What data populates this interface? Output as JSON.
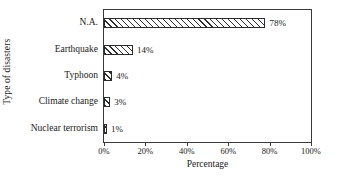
{
  "chart_data": {
    "type": "bar",
    "orientation": "horizontal",
    "title": "",
    "xlabel": "Percentage",
    "ylabel": "Type of disasters",
    "categories": [
      "N.A.",
      "Earthquake",
      "Typhoon",
      "Climate change",
      "Nuclear terrorism"
    ],
    "values": [
      78,
      14,
      4,
      3,
      1
    ],
    "value_labels": [
      "78%",
      "14%",
      "4%",
      "3%",
      "1%"
    ],
    "xlim": [
      0,
      100
    ],
    "x_ticks": [
      0,
      20,
      40,
      60,
      80,
      100
    ],
    "x_tick_labels": [
      "0%",
      "20%",
      "40%",
      "60%",
      "80%",
      "100%"
    ],
    "grid": false,
    "legend": null,
    "bar_style": {
      "fill": "diagonal-hatch",
      "edge_color": "#2b2b2b",
      "face_color": "#ffffff"
    },
    "frame_color": "#3a3a3a"
  }
}
